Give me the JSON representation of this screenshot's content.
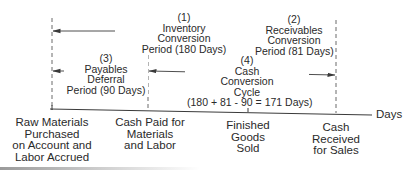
{
  "diagram": {
    "type": "cash-conversion-cycle-timeline",
    "colors": {
      "line": "#3a3a3a",
      "dash": "#6a6a6a",
      "text": "#2a2a2a",
      "background": "#ffffff"
    },
    "periods": [
      {
        "id": 1,
        "number": "(1)",
        "line1": "Inventory",
        "line2": "Conversion",
        "line3": "Period (180 Days)",
        "days": 180
      },
      {
        "id": 2,
        "number": "(2)",
        "line1": "Receivables",
        "line2": "Conversion",
        "line3": "Period (81 Days)",
        "days": 81
      },
      {
        "id": 3,
        "number": "(3)",
        "line1": "Payables",
        "line2": "Deferral",
        "line3": "Period (90 Days)",
        "days": 90
      },
      {
        "id": 4,
        "number": "(4)",
        "line1": "Cash",
        "line2": "Conversion",
        "line3": "Cycle",
        "line4": "(180 + 81 - 90 = 171 Days)",
        "days": 171
      }
    ],
    "axis": {
      "unit_label": "Days",
      "events": [
        {
          "line1": "Raw Materials",
          "line2": "Purchased",
          "line3": "on Account and",
          "line4": "Labor Accrued"
        },
        {
          "line1": "Cash Paid for",
          "line2": "Materials",
          "line3": "and Labor"
        },
        {
          "line1": "Finished",
          "line2": "Goods",
          "line3": "Sold"
        },
        {
          "line1": "Cash",
          "line2": "Received",
          "line3": "for Sales"
        }
      ]
    }
  }
}
